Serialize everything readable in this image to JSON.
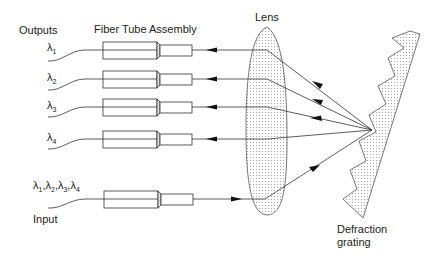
{
  "labels": {
    "outputs": "Outputs",
    "fiber_tube_assembly": "Fiber Tube Assembly",
    "lens": "Lens",
    "grating_line1": "Defraction",
    "grating_line2": "grating",
    "input": "Input"
  },
  "outputs": [
    {
      "label": "λ",
      "sub": "1"
    },
    {
      "label": "λ",
      "sub": "2"
    },
    {
      "label": "λ",
      "sub": "3"
    },
    {
      "label": "λ",
      "sub": "4"
    }
  ],
  "input_wavelengths": "λ1,λ2,λ3,λ4",
  "input_parts": [
    {
      "label": "λ",
      "sub": "1"
    },
    {
      "label": "λ",
      "sub": "2"
    },
    {
      "label": "λ",
      "sub": "3"
    },
    {
      "label": "λ",
      "sub": "4"
    }
  ]
}
